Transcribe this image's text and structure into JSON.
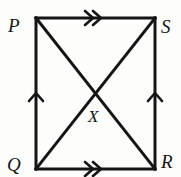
{
  "figure": {
    "kind": "geometry-diagram",
    "background_color": "#fdfdfc",
    "stroke_color": "#151515",
    "stroke_width": 3,
    "width": 181,
    "height": 177,
    "vertices": [
      {
        "id": "P",
        "label": "P",
        "x": 36,
        "y": 18,
        "label_x": 8,
        "label_y": 16
      },
      {
        "id": "S",
        "label": "S",
        "x": 155,
        "y": 18,
        "label_x": 161,
        "label_y": 17
      },
      {
        "id": "R",
        "label": "R",
        "x": 155,
        "y": 169,
        "label_x": 161,
        "label_y": 152
      },
      {
        "id": "Q",
        "label": "Q",
        "x": 36,
        "y": 169,
        "label_x": 7,
        "label_y": 155
      }
    ],
    "interior_points": [
      {
        "id": "X",
        "label": "X",
        "x": 96,
        "y": 93,
        "label_x": 88,
        "label_y": 108
      }
    ],
    "sides": [
      {
        "id": "PS",
        "from": "P",
        "to": "S",
        "tick_marks": 2,
        "tick_direction": "right"
      },
      {
        "id": "QR",
        "from": "Q",
        "to": "R",
        "tick_marks": 2,
        "tick_direction": "right"
      },
      {
        "id": "PQ",
        "from": "Q",
        "to": "P",
        "tick_marks": 1,
        "tick_direction": "up"
      },
      {
        "id": "SR",
        "from": "R",
        "to": "S",
        "tick_marks": 1,
        "tick_direction": "up"
      }
    ],
    "diagonals": [
      {
        "id": "PR",
        "from": "P",
        "to": "R"
      },
      {
        "id": "SQ",
        "from": "S",
        "to": "Q"
      }
    ]
  }
}
